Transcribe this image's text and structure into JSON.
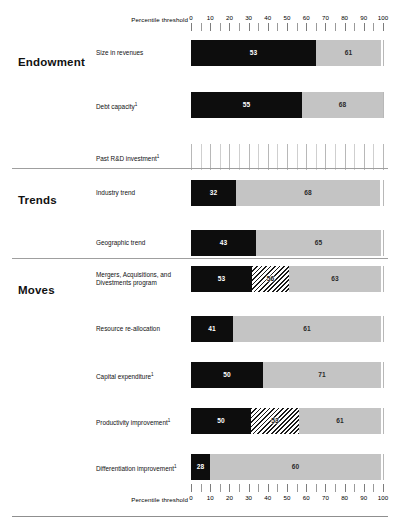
{
  "axis": {
    "title": "Percentile threshold",
    "ticks": [
      0,
      10,
      20,
      30,
      40,
      50,
      60,
      70,
      80,
      90,
      100
    ],
    "min": 0,
    "max": 100,
    "minor_step": 5
  },
  "colors": {
    "black": "#0d0d0d",
    "gray": "#c4c4c4",
    "hatch": "#1a1a1a",
    "grid": "#cfcfcf",
    "divider": "#9f9f9f"
  },
  "groups": [
    {
      "title": "Endowment",
      "rows": [
        {
          "label": "Size in revenues",
          "footnote": "",
          "segments": [
            {
              "style": "black",
              "value": 53,
              "start_px": 0,
              "end_px": 125
            },
            {
              "style": "gray",
              "value": 61,
              "start_px": 125,
              "end_px": 190
            }
          ]
        },
        {
          "label": "Debt capacity",
          "footnote": "1",
          "segments": [
            {
              "style": "black",
              "value": 55,
              "start_px": 0,
              "end_px": 111
            },
            {
              "style": "gray",
              "value": 68,
              "start_px": 111,
              "end_px": 192
            }
          ]
        },
        {
          "label": "Past R&D investment",
          "footnote": "1",
          "segments": []
        }
      ]
    },
    {
      "title": "Trends",
      "rows": [
        {
          "label": "Industry trend",
          "footnote": "",
          "segments": [
            {
              "style": "black",
              "value": 32,
              "start_px": 0,
              "end_px": 45
            },
            {
              "style": "gray",
              "value": 68,
              "start_px": 45,
              "end_px": 189
            }
          ]
        },
        {
          "label": "Geographic trend",
          "footnote": "",
          "segments": [
            {
              "style": "black",
              "value": 43,
              "start_px": 0,
              "end_px": 65
            },
            {
              "style": "gray",
              "value": 65,
              "start_px": 65,
              "end_px": 190
            }
          ]
        }
      ]
    },
    {
      "title": "Moves",
      "rows": [
        {
          "label": "Mergers, Acquisitions, and Divestments program",
          "footnote": "",
          "segments": [
            {
              "style": "black",
              "value": 53,
              "start_px": 0,
              "end_px": 61
            },
            {
              "style": "hatch",
              "value": 56,
              "start_px": 61,
              "end_px": 98
            },
            {
              "style": "gray",
              "value": 63,
              "start_px": 98,
              "end_px": 190
            }
          ]
        },
        {
          "label": "Resource re-allocation",
          "footnote": "",
          "segments": [
            {
              "style": "black",
              "value": 41,
              "start_px": 0,
              "end_px": 42
            },
            {
              "style": "gray",
              "value": 61,
              "start_px": 42,
              "end_px": 190
            }
          ]
        },
        {
          "label": "Capital expenditure",
          "footnote": "1",
          "segments": [
            {
              "style": "black",
              "value": 50,
              "start_px": 0,
              "end_px": 72
            },
            {
              "style": "gray",
              "value": 71,
              "start_px": 72,
              "end_px": 190
            }
          ]
        },
        {
          "label": "Productivity improvement",
          "footnote": "1",
          "segments": [
            {
              "style": "black",
              "value": 50,
              "start_px": 0,
              "end_px": 60
            },
            {
              "style": "hatch",
              "value": 53,
              "start_px": 60,
              "end_px": 108
            },
            {
              "style": "gray",
              "value": 61,
              "start_px": 108,
              "end_px": 190
            }
          ]
        },
        {
          "label": "Differentiation improvement",
          "footnote": "1",
          "segments": [
            {
              "style": "black",
              "value": 28,
              "start_px": 0,
              "end_px": 19
            },
            {
              "style": "gray",
              "value": 60,
              "start_px": 19,
              "end_px": 190
            }
          ]
        }
      ]
    }
  ],
  "chart_data": {
    "type": "bar",
    "title": "",
    "xlabel": "Percentile threshold",
    "ylabel": "",
    "xlim": [
      0,
      100
    ],
    "grid": true,
    "legend": "none",
    "orientation": "horizontal",
    "tick_labels": [
      "0",
      "10",
      "20",
      "30",
      "40",
      "50",
      "60",
      "70",
      "80",
      "90",
      "100"
    ],
    "categories": [
      "Size in revenues",
      "Debt capacity",
      "Past R&D investment",
      "Industry trend",
      "Geographic trend",
      "Mergers, Acquisitions, and Divestments program",
      "Resource re-allocation",
      "Capital expenditure",
      "Productivity improvement",
      "Differentiation improvement"
    ],
    "group_of_category": [
      "Endowment",
      "Endowment",
      "Endowment",
      "Trends",
      "Trends",
      "Moves",
      "Moves",
      "Moves",
      "Moves",
      "Moves"
    ],
    "series": [
      {
        "name": "black segment (lower threshold)",
        "values": [
          53,
          55,
          null,
          32,
          43,
          53,
          41,
          50,
          50,
          28
        ]
      },
      {
        "name": "hatched segment (mid threshold)",
        "values": [
          null,
          null,
          null,
          null,
          null,
          56,
          null,
          null,
          53,
          null
        ]
      },
      {
        "name": "gray segment (upper threshold)",
        "values": [
          61,
          68,
          null,
          68,
          65,
          63,
          61,
          71,
          61,
          60
        ]
      }
    ]
  }
}
